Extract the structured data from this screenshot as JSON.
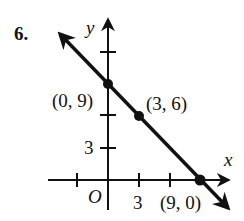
{
  "problem_number": "6.",
  "axes": {
    "x_label": "x",
    "y_label": "y",
    "origin_label": "O",
    "x_tick_label": "3",
    "y_tick_label": "3"
  },
  "points": [
    {
      "label": "(0, 9)",
      "x": 0,
      "y": 9
    },
    {
      "label": "(3, 6)",
      "x": 3,
      "y": 6
    },
    {
      "label": "(9, 0)",
      "x": 9,
      "y": 0
    }
  ],
  "line": {
    "equation": "y = -x + 9",
    "slope": -1,
    "intercept": 9
  },
  "colors": {
    "ink": "#111111",
    "background": "#ffffff"
  }
}
